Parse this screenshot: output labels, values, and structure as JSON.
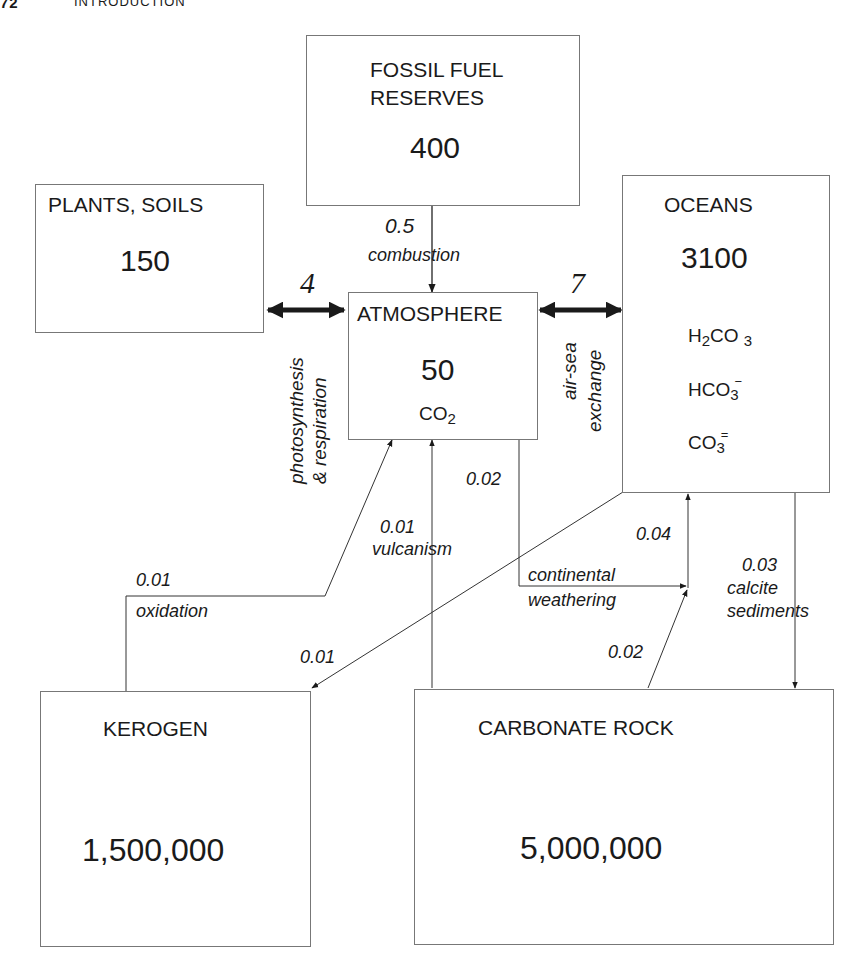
{
  "page": {
    "page_number": "72",
    "running_head": "INTRODUCTION"
  },
  "reservoirs": {
    "fossil": {
      "name_line1": "FOSSIL FUEL",
      "name_line2": "RESERVES",
      "value": "400"
    },
    "plants": {
      "name": "PLANTS, SOILS",
      "value": "150"
    },
    "atmosphere": {
      "name": "ATMOSPHERE",
      "value": "50",
      "species": "CO",
      "species_sub": "2"
    },
    "oceans": {
      "name": "OCEANS",
      "value": "3100",
      "species": [
        {
          "pre": "H",
          "pre_sub": "2",
          "main": "CO",
          "sub": "3",
          "charge": ""
        },
        {
          "pre": "",
          "pre_sub": "",
          "main": "HCO",
          "sub": "3",
          "charge": "−"
        },
        {
          "pre": "",
          "pre_sub": "",
          "main": "CO",
          "sub": "3",
          "charge": "="
        }
      ]
    },
    "kerogen": {
      "name": "KEROGEN",
      "value": "1,500,000"
    },
    "carbonate": {
      "name": "CARBONATE ROCK",
      "value": "5,000,000"
    }
  },
  "fluxes": {
    "combustion": {
      "value": "0.5",
      "label": "combustion"
    },
    "photosynthesis": {
      "value": "4",
      "label_line1": "photosynthesis",
      "label_line2": "& respiration"
    },
    "air_sea": {
      "value": "7",
      "label_line1": "air-sea",
      "label_line2": "exchange"
    },
    "weathering_atm": {
      "value": "0.02"
    },
    "vulcanism": {
      "value": "0.01",
      "label": "vulcanism"
    },
    "oxidation": {
      "value": "0.01",
      "label": "oxidation"
    },
    "ocean_to_kerogen": {
      "value": "0.01"
    },
    "continental_weathering": {
      "value": "0.04",
      "label_line1": "continental",
      "label_line2": "weathering"
    },
    "carbonate_weathering": {
      "value": "0.02"
    },
    "calcite": {
      "value": "0.03",
      "label_line1": "calcite",
      "label_line2": "sediments"
    }
  }
}
